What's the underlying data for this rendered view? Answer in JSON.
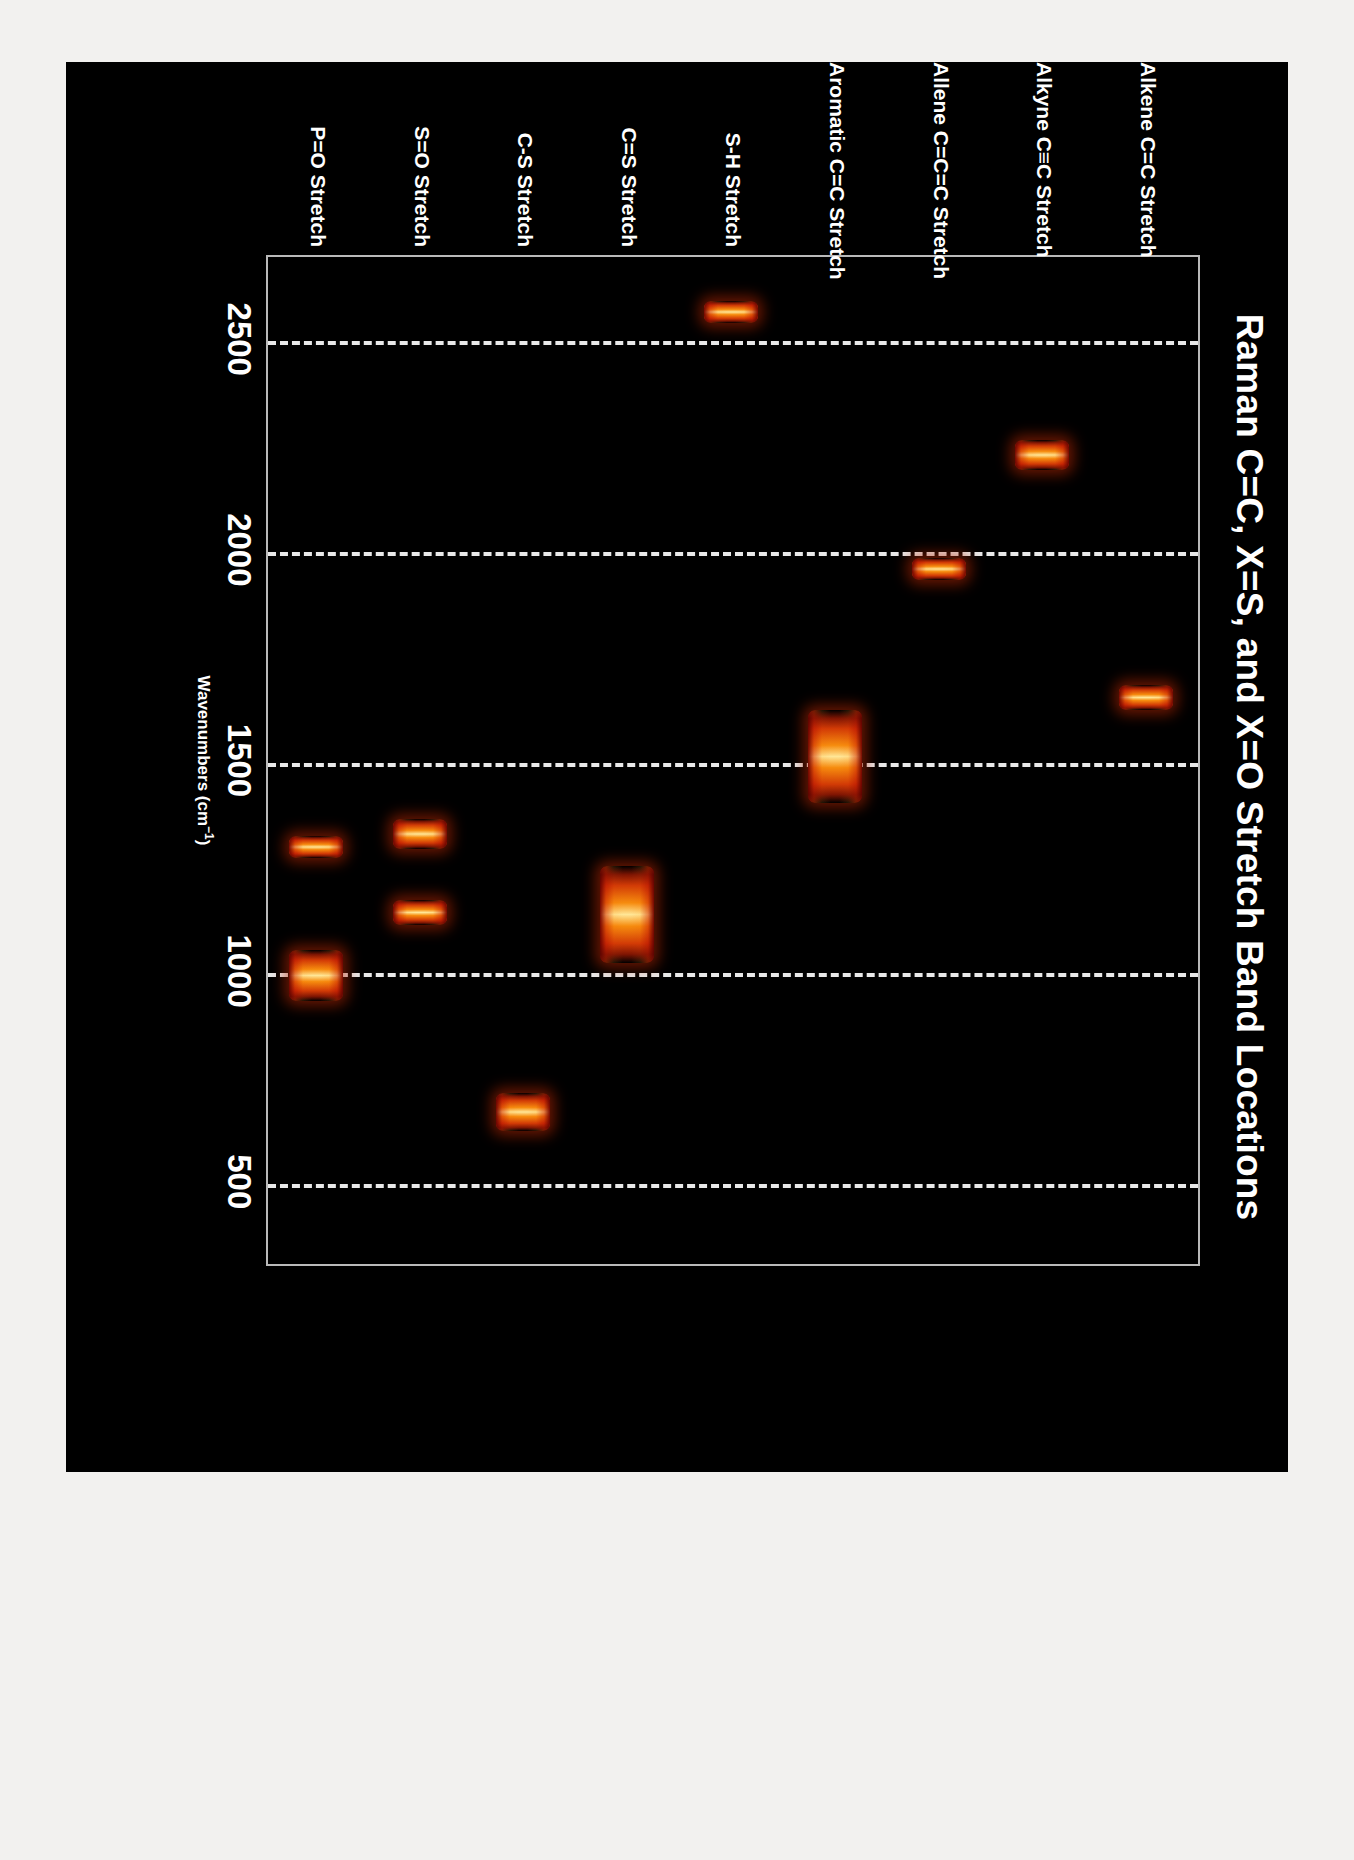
{
  "chart_data": {
    "type": "bar",
    "title": "Raman C=C, X=S, and X=O Stretch Band Locations",
    "xlabel": "Wavenumbers (cm⁻¹)",
    "ylabel": "",
    "xlim": [
      2700,
      300
    ],
    "x_ticks": [
      "2500",
      "2000",
      "1500",
      "1000",
      "500"
    ],
    "x_tick_values": [
      2500,
      2000,
      1500,
      1000,
      500
    ],
    "gridlines": [
      2500,
      2000,
      1500,
      1000,
      500
    ],
    "grid": true,
    "grid_style": "dashed",
    "legend": "none",
    "background": "#000000",
    "categories": [
      "Alkene C=C Stretch",
      "Alkyne C≡C Stretch",
      "Allene C=C=C Stretch",
      "Aromatic C=C Stretch",
      "S-H Stretch",
      "C=S Stretch",
      "C-S Stretch",
      "S=O Stretch",
      "P=O Stretch"
    ],
    "bands": [
      {
        "category": "Alkene C=C Stretch",
        "ranges": [
          [
            1680,
            1620
          ]
        ]
      },
      {
        "category": "Alkyne C≡C Stretch",
        "ranges": [
          [
            2260,
            2190
          ]
        ]
      },
      {
        "category": "Allene C=C=C Stretch",
        "ranges": [
          [
            1980,
            1930
          ]
        ]
      },
      {
        "category": "Aromatic C=C Stretch",
        "ranges": [
          [
            1620,
            1400
          ]
        ]
      },
      {
        "category": "S-H Stretch",
        "ranges": [
          [
            2590,
            2540
          ]
        ]
      },
      {
        "category": "C=S Stretch",
        "ranges": [
          [
            1250,
            1020
          ]
        ]
      },
      {
        "category": "C-S Stretch",
        "ranges": [
          [
            710,
            620
          ]
        ]
      },
      {
        "category": "S=O Stretch",
        "ranges": [
          [
            1360,
            1290
          ],
          [
            1170,
            1110
          ]
        ]
      },
      {
        "category": "P=O Stretch",
        "ranges": [
          [
            1320,
            1280
          ],
          [
            1050,
            930
          ]
        ]
      }
    ],
    "colors": {
      "band_core": "#ffe896",
      "band_mid": "#f68c0e",
      "band_edge": "#b41c03",
      "grid": "#e8e8e8",
      "axis": "#b9b9b9",
      "text": "#ffffff",
      "plot_background": "#000000",
      "page_background": "#f2f1ef"
    }
  }
}
